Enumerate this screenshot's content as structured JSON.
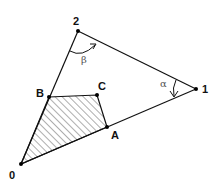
{
  "diagram": {
    "points": {
      "p0": {
        "label": "0",
        "x": 21,
        "y": 164
      },
      "p1": {
        "label": "1",
        "x": 196,
        "y": 89
      },
      "p2": {
        "label": "2",
        "x": 78,
        "y": 31
      },
      "pA": {
        "label": "A",
        "x": 107,
        "y": 127
      },
      "pB": {
        "label": "B",
        "x": 49,
        "y": 97
      },
      "pC": {
        "label": "C",
        "x": 97,
        "y": 95
      }
    },
    "angles": {
      "alpha": {
        "label": "α",
        "at": "1"
      },
      "beta": {
        "label": "β",
        "at": "2"
      }
    },
    "shaded_region": [
      "0",
      "B",
      "C",
      "A"
    ],
    "line_color": "#111111",
    "hatch_color": "#333333"
  }
}
